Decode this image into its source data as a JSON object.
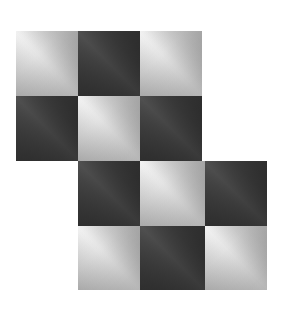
{
  "artwork": {
    "title": "Gradient Checkerboard Pattern",
    "description": "Staircase arrangement of diagonally shaded squares alternating light and dark",
    "background_color": "#ffffff",
    "canvas": {
      "width": 281,
      "height": 313
    }
  },
  "grid": {
    "columns": 4,
    "rows": 4,
    "cell_width": 62,
    "cell_height": 65,
    "origin_x": 16,
    "origin_y": 31,
    "column_x": [
      16,
      78,
      140,
      205
    ],
    "row_y": [
      31,
      96,
      161,
      226
    ]
  },
  "palette": {
    "light_corner": "#c8c8c8",
    "light_band": "#ffffff",
    "light_shadow": "#b5b5b5",
    "dark_corner": "#636363",
    "dark_band": "#909090",
    "dark_shadow": "#656565",
    "background": "#ffffff"
  },
  "gradient": {
    "band_axis": "45deg",
    "shade_axis": "135deg",
    "band_position_percent": 50,
    "direction": "lower-left to upper-right"
  },
  "tiles": [
    {
      "id": "tile-r1-c1",
      "row": 1,
      "col": 1,
      "tone": "light",
      "x": 16,
      "y": 31,
      "w": 62,
      "h": 65
    },
    {
      "id": "tile-r1-c2",
      "row": 1,
      "col": 2,
      "tone": "dark",
      "x": 78,
      "y": 31,
      "w": 62,
      "h": 65
    },
    {
      "id": "tile-r1-c3",
      "row": 1,
      "col": 3,
      "tone": "light",
      "x": 140,
      "y": 31,
      "w": 62,
      "h": 65
    },
    {
      "id": "tile-r2-c1",
      "row": 2,
      "col": 1,
      "tone": "dark",
      "x": 16,
      "y": 96,
      "w": 62,
      "h": 65
    },
    {
      "id": "tile-r2-c2",
      "row": 2,
      "col": 2,
      "tone": "light",
      "x": 78,
      "y": 96,
      "w": 62,
      "h": 65
    },
    {
      "id": "tile-r2-c3",
      "row": 2,
      "col": 3,
      "tone": "dark",
      "x": 140,
      "y": 96,
      "w": 62,
      "h": 65
    },
    {
      "id": "tile-r3-c2",
      "row": 3,
      "col": 2,
      "tone": "dark",
      "x": 78,
      "y": 161,
      "w": 62,
      "h": 65
    },
    {
      "id": "tile-r3-c3",
      "row": 3,
      "col": 3,
      "tone": "light",
      "x": 140,
      "y": 161,
      "w": 65,
      "h": 65
    },
    {
      "id": "tile-r3-c4",
      "row": 3,
      "col": 4,
      "tone": "dark",
      "x": 205,
      "y": 161,
      "w": 62,
      "h": 65
    },
    {
      "id": "tile-r4-c2",
      "row": 4,
      "col": 2,
      "tone": "light",
      "x": 78,
      "y": 226,
      "w": 62,
      "h": 64
    },
    {
      "id": "tile-r4-c3",
      "row": 4,
      "col": 3,
      "tone": "dark",
      "x": 140,
      "y": 226,
      "w": 65,
      "h": 64
    },
    {
      "id": "tile-r4-c4",
      "row": 4,
      "col": 4,
      "tone": "light",
      "x": 205,
      "y": 226,
      "w": 62,
      "h": 64
    }
  ]
}
